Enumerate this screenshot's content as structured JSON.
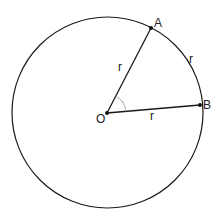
{
  "diagram": {
    "center": {
      "label": "O",
      "x": 107,
      "y": 113
    },
    "radius": 96,
    "points": [
      {
        "label": "A",
        "x": 151,
        "y": 28
      },
      {
        "label": "B",
        "x": 200,
        "y": 105
      }
    ],
    "segment_labels": {
      "OA": "r",
      "OB": "r",
      "arc_AB": "r"
    },
    "stroke_color": "#1a1a1a",
    "angle_mark_color": "#999999"
  }
}
